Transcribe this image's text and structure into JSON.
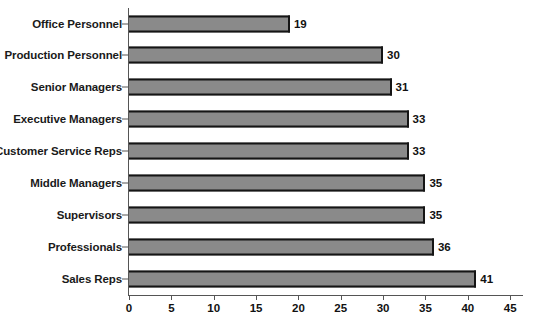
{
  "chart_data": {
    "type": "bar",
    "orientation": "horizontal",
    "title": "",
    "subtitle": "",
    "xlabel": "",
    "ylabel": "",
    "categories": [
      "Office Personnel",
      "Production Personnel",
      "Senior Managers",
      "Executive Managers",
      "Customer Service Reps",
      "Middle Managers",
      "Supervisors",
      "Professionals",
      "Sales Reps"
    ],
    "values": [
      19,
      30,
      31,
      33,
      33,
      35,
      35,
      36,
      41
    ],
    "data_labels": [
      "19",
      "30",
      "31",
      "33",
      "33",
      "35",
      "35",
      "36",
      "41"
    ],
    "xlim": [
      0,
      47
    ],
    "xticks": [
      0,
      5,
      10,
      15,
      20,
      25,
      30,
      35,
      40,
      45
    ],
    "xtick_labels": [
      "0",
      "5",
      "10",
      "15",
      "20",
      "25",
      "30",
      "35",
      "40",
      "45"
    ],
    "grid": false,
    "legend": false,
    "legend_position": "none",
    "bar_fill_color": "#8a8a8a",
    "bar_border_color": "#151515",
    "axis_color": "#555555",
    "background_color": "#ffffff",
    "text_color": "#111111"
  }
}
